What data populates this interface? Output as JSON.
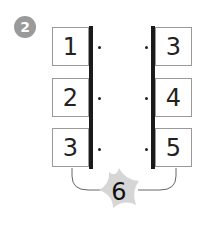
{
  "exercise": {
    "number": "2",
    "left_column": [
      "1",
      "2",
      "3"
    ],
    "right_column": [
      "3",
      "4",
      "5"
    ],
    "result": "6"
  },
  "colors": {
    "badge": "#9a9a9a",
    "star": "#d6d6d6",
    "bar": "#1a1a1a"
  }
}
